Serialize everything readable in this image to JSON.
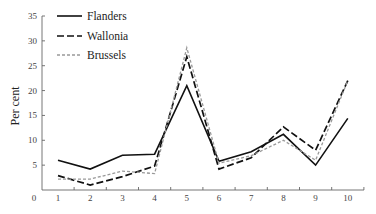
{
  "chart_data": {
    "type": "line",
    "title": "",
    "xlabel": "",
    "ylabel": "Per cent",
    "x": [
      1,
      2,
      3,
      4,
      5,
      6,
      7,
      8,
      9,
      10
    ],
    "x_tick_labels": [
      "0",
      "1",
      "2",
      "3",
      "4",
      "5",
      "6",
      "7",
      "8",
      "9",
      "10"
    ],
    "y_tick_labels": [
      "5",
      "10",
      "15",
      "20",
      "25",
      "30",
      "35"
    ],
    "y_ticks": [
      5,
      10,
      15,
      20,
      25,
      30,
      35
    ],
    "ylim": [
      0,
      35
    ],
    "xlim": [
      0.5,
      10.5
    ],
    "grid": false,
    "legend_position": "top-left",
    "series": [
      {
        "name": "Flanders",
        "style": "solid",
        "color": "#111111",
        "values": [
          6.0,
          4.2,
          7.0,
          7.2,
          21.0,
          5.8,
          7.7,
          11.2,
          5.0,
          14.4
        ]
      },
      {
        "name": "Wallonia",
        "style": "long-dash",
        "color": "#111111",
        "values": [
          2.9,
          1.0,
          2.7,
          4.8,
          26.8,
          4.2,
          6.5,
          12.7,
          8.0,
          22.0
        ]
      },
      {
        "name": "Brussels",
        "style": "short-dash",
        "color": "#999999",
        "values": [
          2.2,
          2.2,
          3.8,
          3.3,
          28.6,
          5.4,
          6.9,
          10.0,
          6.0,
          22.0
        ]
      }
    ]
  }
}
